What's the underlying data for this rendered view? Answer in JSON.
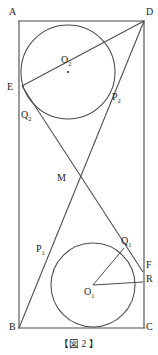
{
  "figure": {
    "caption": "【図 2 】",
    "stroke_color": "#4a4a4a",
    "label_color": "#1b1b1b",
    "background": "#ffffff",
    "rectangle": {
      "name": "ABCD",
      "corners": {
        "A": {
          "label": "A",
          "x": 19,
          "y": 21
        },
        "D": {
          "label": "D",
          "x": 144,
          "y": 21
        },
        "B": {
          "label": "B",
          "x": 19,
          "y": 328
        },
        "C": {
          "label": "C",
          "x": 144,
          "y": 328
        }
      }
    },
    "circles": [
      {
        "center_label": "O",
        "center_sub": "2",
        "cx": 68,
        "cy": 72,
        "r": 47
      },
      {
        "center_label": "O",
        "center_sub": "1",
        "cx": 93,
        "cy": 285,
        "r": 42
      }
    ],
    "points": [
      {
        "label": "A",
        "sub": "",
        "x": 19,
        "y": 21
      },
      {
        "label": "D",
        "sub": "",
        "x": 144,
        "y": 21
      },
      {
        "label": "B",
        "sub": "",
        "x": 19,
        "y": 328
      },
      {
        "label": "C",
        "sub": "",
        "x": 144,
        "y": 328
      },
      {
        "label": "E",
        "sub": "",
        "x": 21,
        "y": 88
      },
      {
        "label": "P",
        "sub": "2",
        "x": 111,
        "y": 100
      },
      {
        "label": "Q",
        "sub": "2",
        "x": 31,
        "y": 114
      },
      {
        "label": "M",
        "sub": "",
        "x": 70,
        "y": 180
      },
      {
        "label": "P",
        "sub": "1",
        "x": 51,
        "y": 251
      },
      {
        "label": "Q",
        "sub": "1",
        "x": 121,
        "y": 245
      },
      {
        "label": "F",
        "sub": "",
        "x": 143,
        "y": 267
      },
      {
        "label": "R",
        "sub": "",
        "x": 143,
        "y": 281
      }
    ],
    "labels": [
      {
        "name": "point-label-A",
        "text": "A",
        "sub": "",
        "x": 9,
        "y": 7
      },
      {
        "name": "point-label-D",
        "text": "D",
        "sub": "",
        "x": 146,
        "y": 7
      },
      {
        "name": "point-label-B",
        "text": "B",
        "sub": "",
        "x": 9,
        "y": 324
      },
      {
        "name": "point-label-C",
        "text": "C",
        "sub": "",
        "x": 146,
        "y": 324
      },
      {
        "name": "point-label-E",
        "text": "E",
        "sub": "",
        "x": 7,
        "y": 82
      },
      {
        "name": "center-label-O2",
        "text": "O",
        "sub": "2",
        "x": 61,
        "y": 57
      },
      {
        "name": "point-label-P2",
        "text": "P",
        "sub": "2",
        "x": 113,
        "y": 94
      },
      {
        "name": "point-label-Q2",
        "text": "Q",
        "sub": "2",
        "x": 22,
        "y": 112
      },
      {
        "name": "point-label-M",
        "text": "M",
        "sub": "",
        "x": 58,
        "y": 174
      },
      {
        "name": "point-label-P1",
        "text": "P",
        "sub": "1",
        "x": 37,
        "y": 245
      },
      {
        "name": "point-label-Q1",
        "text": "Q",
        "sub": "1",
        "x": 122,
        "y": 238
      },
      {
        "name": "point-label-F",
        "text": "F",
        "sub": "",
        "x": 146,
        "y": 261
      },
      {
        "name": "point-label-R",
        "text": "R",
        "sub": "",
        "x": 146,
        "y": 275
      },
      {
        "name": "center-label-O1",
        "text": "O",
        "sub": "1",
        "x": 85,
        "y": 288
      }
    ],
    "segments": [
      {
        "name": "rect-side-AD",
        "x1": 19,
        "y1": 21,
        "x2": 144,
        "y2": 21
      },
      {
        "name": "rect-side-AB",
        "x1": 19,
        "y1": 21,
        "x2": 19,
        "y2": 328
      },
      {
        "name": "rect-side-BC",
        "x1": 19,
        "y1": 328,
        "x2": 144,
        "y2": 328
      },
      {
        "name": "rect-side-DC",
        "x1": 144,
        "y1": 21,
        "x2": 144,
        "y2": 328
      },
      {
        "name": "tangent-line-B-to-D",
        "x1": 19,
        "y1": 328,
        "x2": 144,
        "y2": 21
      },
      {
        "name": "tangent-line-D-to-B",
        "x1": 144,
        "y1": 21,
        "x2": 22,
        "y2": 86
      },
      {
        "name": "radius-O1-to-Q1",
        "x1": 93,
        "y1": 285,
        "x2": 124,
        "y2": 248
      },
      {
        "name": "radius-O1-to-R",
        "x1": 93,
        "y1": 285,
        "x2": 143,
        "y2": 282
      }
    ]
  }
}
